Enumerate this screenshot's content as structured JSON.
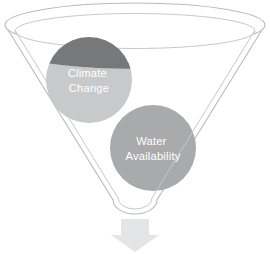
{
  "diagram": {
    "type": "funnel",
    "title": "",
    "background_color": "#ffffff",
    "funnel": {
      "name": "funnel-shape",
      "fill_color": "#ffffff",
      "stroke_color": "#b9bbbd",
      "rim_outer_label": "funnel-outer-rim",
      "rim_inner_label": "funnel-inner-rim"
    },
    "arrow": {
      "name": "output-arrow",
      "direction": "down",
      "fill_color": "#e4e5e6"
    },
    "bubbles": [
      {
        "id": "climate-change",
        "line1": "Climate",
        "line2": "Change",
        "color_above_rim": "#77787a",
        "color_below_rim": "#c8c9cb",
        "text_color": "#ffffff",
        "cx": 89,
        "cy": 80,
        "r": 43
      },
      {
        "id": "water-availability",
        "line1": "Water",
        "line2": "Availability",
        "color_above_rim": "#a9aaac",
        "color_below_rim": "#a9aaac",
        "text_color": "#ffffff",
        "cx": 153,
        "cy": 148,
        "r": 43
      }
    ]
  }
}
